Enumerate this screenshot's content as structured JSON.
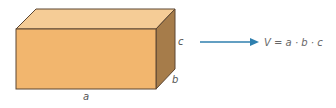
{
  "diagram": {
    "box": {
      "colors": {
        "front": "#f2b66e",
        "top": "#f5cc96",
        "side": "#a67c4a",
        "edge": "#5c4632"
      },
      "labels": {
        "a": "a",
        "b": "b",
        "c": "c"
      }
    },
    "arrow": {
      "color": "#2f7fae"
    },
    "formula": "V = a · b · c"
  }
}
